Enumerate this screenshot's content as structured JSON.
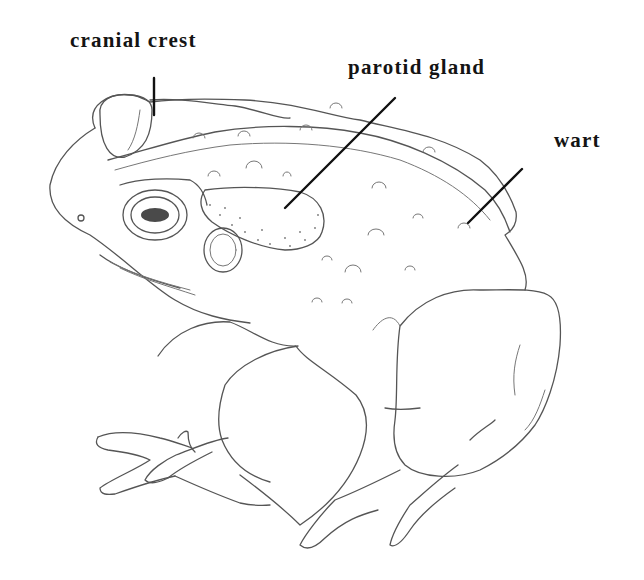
{
  "figure": {
    "labels": [
      {
        "id": "cranial_crest",
        "text": "cranial crest"
      },
      {
        "id": "parotid_gland",
        "text": "parotid gland"
      },
      {
        "id": "wart",
        "text": "wart"
      }
    ],
    "colors": {
      "line": "#555555",
      "label": "#141414",
      "background": "#ffffff"
    }
  }
}
